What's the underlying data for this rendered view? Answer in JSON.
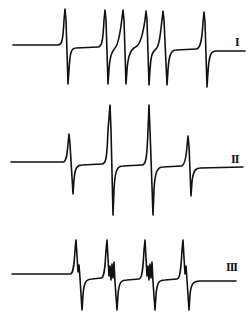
{
  "figure": {
    "type": "EPR spectra",
    "spectra": [
      {
        "id": "I",
        "label": "I",
        "lines": 6,
        "baseline_y": 45,
        "peaks_x": [
          65,
          105,
          123,
          146,
          163,
          204
        ]
      },
      {
        "id": "II",
        "label": "II",
        "lines": 4,
        "baseline_y": 162,
        "peaks_x": [
          69,
          110,
          149,
          188
        ],
        "relative_intensities": [
          1,
          2,
          2,
          1
        ]
      },
      {
        "id": "III",
        "label": "III",
        "lines": 4,
        "baseline_y": 274,
        "peaks_x": [
          76,
          107,
          145,
          183
        ],
        "hyperfine_substructure": true
      }
    ],
    "colors": {
      "trace": "#111111",
      "background": "#ffffff"
    }
  }
}
